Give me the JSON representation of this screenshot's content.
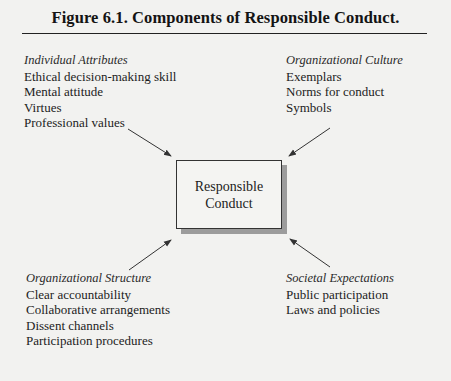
{
  "figure": {
    "title": "Figure 6.1.  Components of Responsible Conduct.",
    "center": {
      "lines": [
        "Responsible",
        "Conduct"
      ]
    },
    "groups": {
      "individual_attributes": {
        "heading": "Individual Attributes",
        "items": [
          "Ethical decision-making skill",
          "Mental attitude",
          "Virtues",
          "Professional values"
        ]
      },
      "organizational_culture": {
        "heading": "Organizational Culture",
        "items": [
          "Exemplars",
          "Norms for conduct",
          "Symbols"
        ]
      },
      "organizational_structure": {
        "heading": "Organizational Structure",
        "items": [
          "Clear accountability",
          "Collaborative arrangements",
          "Dissent channels",
          "Participation procedures"
        ]
      },
      "societal_expectations": {
        "heading": "Societal Expectations",
        "items": [
          "Public participation",
          "Laws and policies"
        ]
      }
    },
    "arrows": [
      {
        "from": "individual_attributes",
        "to": "center"
      },
      {
        "from": "organizational_culture",
        "to": "center"
      },
      {
        "from": "organizational_structure",
        "to": "center"
      },
      {
        "from": "societal_expectations",
        "to": "center"
      }
    ],
    "colors": {
      "background": "#f2f2f0",
      "text": "#1c1c1c",
      "box_shadow": "#9c9c9c",
      "arrow": "#333333"
    }
  }
}
